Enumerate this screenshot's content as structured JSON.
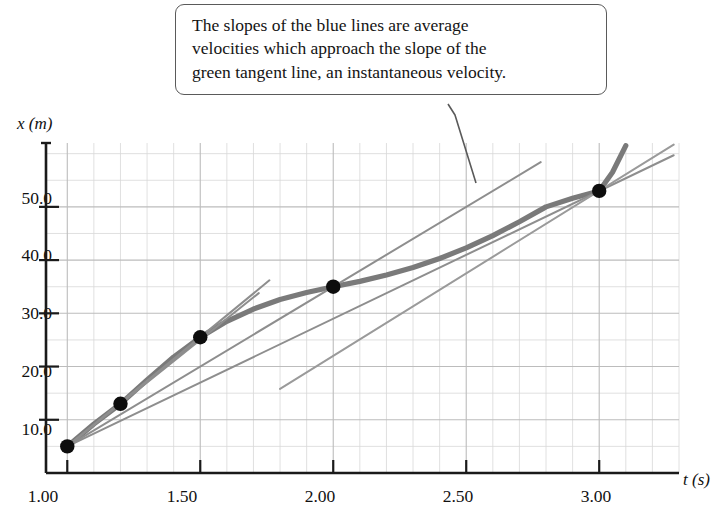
{
  "callout": {
    "line1": "The slopes of the blue lines are average",
    "line2": "velocities which approach the slope of the",
    "line3": "green tangent line, an instantaneous velocity."
  },
  "axes": {
    "y_label": "x (m)",
    "x_label": "t (s)",
    "y_ticks": [
      "50.0",
      "40.0",
      "30.0",
      "20.0",
      "10.0"
    ],
    "x_ticks": [
      "1.00",
      "1.50",
      "2.00",
      "2.50",
      "3.00"
    ]
  },
  "colors": {
    "curve": "#7a7a7a",
    "secant": "#8e8e8e",
    "tangent": "#9a9a9a",
    "grid_minor": "#d8d8d8",
    "grid_major": "#bcbcbc",
    "axis": "#1a1a1a",
    "point": "#0d0d0d",
    "callout_border": "#5a5a5a"
  },
  "chart_data": {
    "type": "line",
    "title": "",
    "xlabel": "t (s)",
    "ylabel": "x (m)",
    "xlim": [
      0.92,
      3.3
    ],
    "ylim": [
      0.0,
      62.0
    ],
    "grid": true,
    "legend": "none",
    "x_tick_values": [
      1.0,
      1.5,
      2.0,
      2.5,
      3.0
    ],
    "y_tick_values": [
      10.0,
      20.0,
      30.0,
      40.0,
      50.0
    ],
    "annotations": [
      "The slopes of the blue lines are average velocities which approach the slope of the green tangent line, an instantaneous velocity."
    ],
    "series": [
      {
        "name": "position curve x(t)",
        "type": "line",
        "style": "thick-gray",
        "x": [
          1.0,
          1.1,
          1.2,
          1.3,
          1.4,
          1.5,
          1.6,
          1.7,
          1.8,
          1.9,
          2.0,
          2.1,
          2.2,
          2.3,
          2.4,
          2.5,
          2.6,
          2.7,
          2.8,
          2.9,
          3.0,
          3.05,
          3.1
        ],
        "y": [
          5.0,
          9.2,
          13.0,
          17.5,
          21.8,
          25.5,
          28.5,
          30.8,
          32.6,
          33.9,
          35.0,
          36.0,
          37.2,
          38.6,
          40.3,
          42.3,
          44.6,
          47.2,
          50.0,
          51.6,
          53.0,
          56.5,
          61.5
        ]
      },
      {
        "name": "secant line 1 (1.00 to 1.20)",
        "type": "line",
        "style": "thin-gray",
        "slope": 40.0,
        "x": [
          1.0,
          1.72
        ],
        "y": [
          5.0,
          33.8
        ]
      },
      {
        "name": "secant line 2 (1.00 to 1.50)",
        "type": "line",
        "style": "thin-gray",
        "slope": 41.0,
        "x": [
          1.0,
          1.76
        ],
        "y": [
          5.0,
          36.2
        ]
      },
      {
        "name": "secant line 3 (1.00 to 2.00)",
        "type": "line",
        "style": "thin-gray",
        "slope": 30.0,
        "x": [
          1.0,
          2.78
        ],
        "y": [
          5.0,
          58.4
        ]
      },
      {
        "name": "secant line 4 (1.00 to 3.00)",
        "type": "line",
        "style": "thin-gray",
        "slope": 24.0,
        "x": [
          1.0,
          3.28
        ],
        "y": [
          5.0,
          59.7
        ]
      },
      {
        "name": "tangent line at t = 3.00",
        "type": "line",
        "style": "thin-gray-tangent",
        "slope": 31.0,
        "x": [
          1.8,
          3.28
        ],
        "y": [
          15.8,
          61.7
        ]
      }
    ],
    "points": [
      {
        "label": "",
        "x": 1.0,
        "y": 5.0
      },
      {
        "label": "",
        "x": 1.2,
        "y": 13.0
      },
      {
        "label": "",
        "x": 1.5,
        "y": 25.5
      },
      {
        "label": "",
        "x": 2.0,
        "y": 35.0
      },
      {
        "label": "",
        "x": 3.0,
        "y": 53.0
      }
    ]
  }
}
